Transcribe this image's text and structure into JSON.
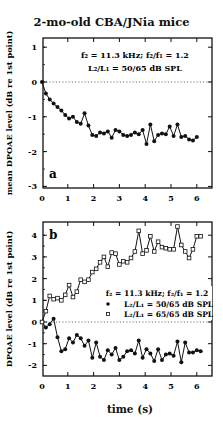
{
  "title": "2-mo-old CBA/JNia mice",
  "chart_data": [
    {
      "type": "line",
      "panel": "a",
      "title": "2-mo-old CBA/JNia mice",
      "annotation": [
        "f2 = 11.3 kHz; f2/f1 = 1.2",
        "L2/L1 = 50/65 dB SPL"
      ],
      "xlabel": "",
      "ylabel": "mean DPOAE level (dB re 1st point)",
      "xlim": [
        0,
        6.5
      ],
      "ylim": [
        -3.1,
        1.25
      ],
      "xticks": [
        0,
        1,
        2,
        3,
        4,
        5,
        6
      ],
      "yticks": [
        1,
        0,
        -1,
        -2,
        -3
      ],
      "reference_line": 0,
      "series": [
        {
          "name": "L2/L1 = 50/65 dB SPL",
          "marker": "filled-circle",
          "x": [
            0,
            0.15,
            0.3,
            0.45,
            0.6,
            0.75,
            0.9,
            1.05,
            1.2,
            1.35,
            1.5,
            1.65,
            1.8,
            1.95,
            2.1,
            2.25,
            2.4,
            2.55,
            2.7,
            2.85,
            3.0,
            3.15,
            3.3,
            3.45,
            3.6,
            3.75,
            3.9,
            4.05,
            4.2,
            4.35,
            4.5,
            4.65,
            4.8,
            4.95,
            5.1,
            5.25,
            5.4,
            5.55,
            5.7,
            5.85,
            6.0
          ],
          "y": [
            0,
            -0.33,
            -0.5,
            -0.62,
            -0.72,
            -0.82,
            -0.95,
            -1.05,
            -1.0,
            -1.15,
            -1.2,
            -0.9,
            -1.25,
            -1.52,
            -1.55,
            -1.45,
            -1.48,
            -1.42,
            -1.6,
            -1.38,
            -1.42,
            -1.52,
            -1.55,
            -1.52,
            -1.45,
            -1.5,
            -1.38,
            -1.78,
            -1.22,
            -1.7,
            -1.52,
            -1.48,
            -1.5,
            -1.28,
            -1.55,
            -1.22,
            -1.58,
            -1.55,
            -1.65,
            -1.68,
            -1.58
          ]
        }
      ]
    },
    {
      "type": "line",
      "panel": "b",
      "annotation": [
        "f2 = 11.3 kHz; f2/f1 = 1.2"
      ],
      "xlabel": "time (s)",
      "ylabel": "DPOAE level (dB re 1st point)",
      "xlim": [
        0,
        6.5
      ],
      "ylim": [
        -2.5,
        4.6
      ],
      "xticks": [
        0,
        1,
        2,
        3,
        4,
        5,
        6
      ],
      "yticks": [
        4,
        3,
        2,
        1,
        0,
        -1,
        -2
      ],
      "reference_line": 0,
      "legend": [
        "L2/L1 = 50/65 dB SPL",
        "L2/L1 = 65/65 dB SPL"
      ],
      "series": [
        {
          "name": "L2/L1 = 50/65 dB SPL",
          "marker": "filled-circle",
          "x": [
            0,
            0.15,
            0.3,
            0.45,
            0.6,
            0.75,
            0.9,
            1.05,
            1.2,
            1.35,
            1.5,
            1.65,
            1.8,
            1.95,
            2.1,
            2.25,
            2.4,
            2.55,
            2.7,
            2.85,
            3.0,
            3.15,
            3.3,
            3.45,
            3.6,
            3.75,
            3.9,
            4.05,
            4.2,
            4.35,
            4.5,
            4.65,
            4.8,
            4.95,
            5.1,
            5.25,
            5.4,
            5.55,
            5.7,
            5.85,
            6.0,
            6.15
          ],
          "y": [
            0,
            -0.25,
            -0.1,
            0.15,
            -0.7,
            -1.35,
            -1.25,
            -0.75,
            -0.95,
            -0.6,
            -0.75,
            -1.1,
            -0.85,
            -1.65,
            -0.95,
            -1.6,
            -1.75,
            -1.3,
            -1.5,
            -1.2,
            -1.75,
            -1.6,
            -1.35,
            -1.3,
            -1.45,
            -0.85,
            -1.65,
            -1.25,
            -1.45,
            -1.8,
            -1.25,
            -1.75,
            -1.5,
            -1.45,
            -1.55,
            -0.9,
            -1.85,
            -0.95,
            -1.4,
            -1.4,
            -1.3,
            -1.35
          ]
        },
        {
          "name": "L2/L1 = 65/65 dB SPL",
          "marker": "open-square",
          "x": [
            0,
            0.15,
            0.3,
            0.45,
            0.6,
            0.75,
            0.9,
            1.05,
            1.2,
            1.35,
            1.5,
            1.65,
            1.8,
            1.95,
            2.1,
            2.25,
            2.4,
            2.55,
            2.7,
            2.85,
            3.0,
            3.15,
            3.3,
            3.45,
            3.6,
            3.75,
            3.9,
            4.05,
            4.2,
            4.35,
            4.5,
            4.65,
            4.8,
            4.95,
            5.1,
            5.25,
            5.4,
            5.55,
            5.7,
            5.85,
            6.0,
            6.15
          ],
          "y": [
            0,
            0.5,
            1.2,
            1.05,
            1.1,
            1.0,
            1.25,
            1.7,
            1.15,
            1.4,
            1.95,
            1.85,
            1.95,
            2.3,
            2.45,
            2.75,
            3.0,
            2.55,
            3.2,
            3.15,
            2.65,
            2.8,
            2.75,
            2.95,
            3.25,
            4.2,
            3.15,
            3.3,
            3.95,
            3.25,
            3.7,
            3.45,
            3.4,
            3.35,
            3.35,
            4.4,
            3.55,
            3.25,
            2.95,
            3.35,
            3.95,
            3.95
          ]
        }
      ]
    }
  ],
  "panel_a": {
    "label": "a",
    "ylabel": "mean DPOAE level (dB re 1st point)",
    "annotation_line1": "f₂ = 11.3 kHz; f₂/f₁ = 1.2",
    "annotation_line2": "L₂/L₁ = 50/65 dB SPL"
  },
  "panel_b": {
    "label": "b",
    "ylabel": "DPOAE level (dB re 1st point)",
    "annotation_line1": "f₂ = 11.3 kHz; f₂/f₁ = 1.2",
    "legend_filled": "L₂/L₁ = 50/65 dB SPL",
    "legend_open": "L₂/L₁ = 65/65 dB SPL"
  },
  "xlabel": "time (s)"
}
